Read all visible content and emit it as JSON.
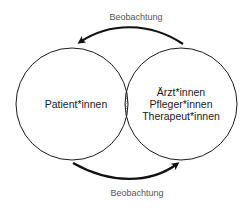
{
  "diagram": {
    "left_circle": {
      "label": "Patient*innen"
    },
    "right_circle": {
      "lines": [
        "Ärzt*innen",
        "Pfleger*innen",
        "Therapeut*innen"
      ]
    },
    "top_arrow": {
      "label": "Beobachtung",
      "direction": "right-to-left"
    },
    "bottom_arrow": {
      "label": "Beobachtung",
      "direction": "left-to-right"
    },
    "overlap": {
      "pattern": "crosshatch"
    }
  },
  "colors": {
    "stroke": "#1a1a1a",
    "arrow": "#111111",
    "caption": "#555555",
    "hatch": "#777777"
  }
}
